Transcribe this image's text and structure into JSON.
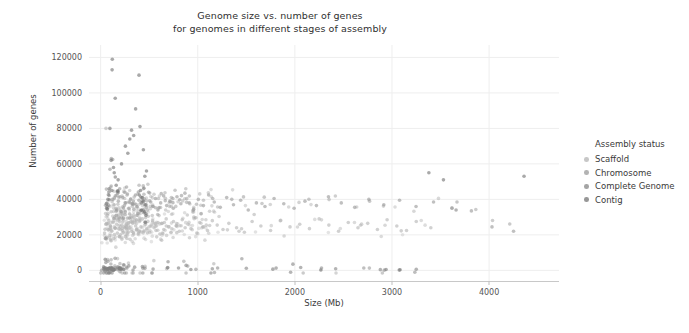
{
  "chart_data": {
    "type": "scatter",
    "title": "Genome size vs. number of genes\nfor genomes in different stages of assembly",
    "title_line1": "Genome size vs. number of genes",
    "title_line2": "for genomes in different stages of assembly",
    "xlabel": "Size (Mb)",
    "ylabel": "Number of genes",
    "xlim": [
      -120,
      4720
    ],
    "ylim": [
      -6000,
      127000
    ],
    "xticks": [
      0,
      1000,
      2000,
      3000,
      4000
    ],
    "xticklabels": [
      "0",
      "1000",
      "2000",
      "3000",
      "4000"
    ],
    "yticks": [
      0,
      20000,
      40000,
      60000,
      80000,
      100000,
      120000
    ],
    "yticklabels": [
      "0",
      "20000",
      "40000",
      "60000",
      "80000",
      "100000",
      "120000"
    ],
    "grid": true,
    "grid_color": "#eeeeee",
    "legend": {
      "title": "Assembly status",
      "position": "right",
      "entries": [
        {
          "label": "Scaffold",
          "color": "#b4b4b4"
        },
        {
          "label": "Chromosome",
          "color": "#9a9a9a"
        },
        {
          "label": "Complete Genome",
          "color": "#868686"
        },
        {
          "label": "Contig",
          "color": "#747474"
        }
      ]
    },
    "marker": {
      "shape": "circle",
      "size_px": 3.6,
      "opacity": 0.62,
      "base_color": "#808080"
    },
    "series": [
      {
        "name": "Scaffold",
        "color": "#b4b4b4",
        "points": [
          [
            40,
            21000
          ],
          [
            55,
            80000
          ],
          [
            62,
            26500
          ],
          [
            70,
            31000
          ],
          [
            78,
            23000
          ],
          [
            85,
            28000
          ],
          [
            92,
            19500
          ],
          [
            100,
            25000
          ],
          [
            108,
            33000
          ],
          [
            115,
            22000
          ],
          [
            120,
            40000
          ],
          [
            128,
            27000
          ],
          [
            135,
            18000
          ],
          [
            142,
            30000
          ],
          [
            150,
            24000
          ],
          [
            158,
            35000
          ],
          [
            165,
            26000
          ],
          [
            172,
            21000
          ],
          [
            180,
            29000
          ],
          [
            188,
            23500
          ],
          [
            195,
            27500
          ],
          [
            202,
            20000
          ],
          [
            210,
            32000
          ],
          [
            218,
            25500
          ],
          [
            225,
            22500
          ],
          [
            232,
            28500
          ],
          [
            240,
            24500
          ],
          [
            248,
            31500
          ],
          [
            255,
            19000
          ],
          [
            262,
            26000
          ],
          [
            270,
            23000
          ],
          [
            278,
            29500
          ],
          [
            285,
            21500
          ],
          [
            292,
            27000
          ],
          [
            300,
            24000
          ],
          [
            310,
            30000
          ],
          [
            320,
            22000
          ],
          [
            330,
            26500
          ],
          [
            340,
            20500
          ],
          [
            350,
            28000
          ],
          [
            360,
            25000
          ],
          [
            370,
            23000
          ],
          [
            380,
            31000
          ],
          [
            390,
            21000
          ],
          [
            400,
            27500
          ],
          [
            415,
            24500
          ],
          [
            430,
            29000
          ],
          [
            445,
            22000
          ],
          [
            460,
            26000
          ],
          [
            475,
            23500
          ],
          [
            490,
            30500
          ],
          [
            505,
            21500
          ],
          [
            520,
            25500
          ],
          [
            535,
            28000
          ],
          [
            550,
            24000
          ],
          [
            570,
            22500
          ],
          [
            590,
            27000
          ],
          [
            610,
            20500
          ],
          [
            630,
            26500
          ],
          [
            650,
            23000
          ],
          [
            675,
            29000
          ],
          [
            700,
            24500
          ],
          [
            725,
            21500
          ],
          [
            750,
            27500
          ],
          [
            780,
            25000
          ],
          [
            810,
            22000
          ],
          [
            840,
            28500
          ],
          [
            870,
            24000
          ],
          [
            900,
            26000
          ],
          [
            930,
            23500
          ],
          [
            960,
            30000
          ],
          [
            990,
            21000
          ],
          [
            1020,
            27000
          ],
          [
            1060,
            24500
          ],
          [
            1100,
            22500
          ],
          [
            1150,
            28000
          ],
          [
            1200,
            25500
          ],
          [
            1260,
            23000
          ],
          [
            1320,
            26500
          ],
          [
            1400,
            24000
          ],
          [
            1480,
            21500
          ],
          [
            1560,
            27500
          ],
          [
            1650,
            25000
          ],
          [
            1750,
            22500
          ],
          [
            1850,
            28000
          ],
          [
            1950,
            24500
          ],
          [
            2050,
            26000
          ],
          [
            2150,
            23500
          ],
          [
            2250,
            29000
          ],
          [
            2350,
            25500
          ],
          [
            2450,
            22000
          ],
          [
            2550,
            27000
          ],
          [
            2650,
            24000
          ],
          [
            2750,
            26500
          ],
          [
            2850,
            23000
          ],
          [
            2950,
            28500
          ],
          [
            3050,
            25000
          ],
          [
            3150,
            22500
          ],
          [
            3250,
            27500
          ],
          [
            3400,
            24000
          ]
        ]
      },
      {
        "name": "Chromosome",
        "color": "#9a9a9a",
        "points": [
          [
            48,
            18000
          ],
          [
            66,
            36000
          ],
          [
            84,
            44000
          ],
          [
            96,
            57000
          ],
          [
            110,
            63000
          ],
          [
            124,
            62500
          ],
          [
            138,
            37000
          ],
          [
            152,
            42000
          ],
          [
            166,
            34000
          ],
          [
            182,
            39000
          ],
          [
            196,
            46000
          ],
          [
            212,
            33000
          ],
          [
            228,
            41000
          ],
          [
            244,
            36500
          ],
          [
            260,
            38000
          ],
          [
            276,
            43000
          ],
          [
            292,
            35000
          ],
          [
            308,
            40000
          ],
          [
            324,
            37500
          ],
          [
            342,
            34500
          ],
          [
            358,
            42500
          ],
          [
            376,
            36000
          ],
          [
            394,
            39500
          ],
          [
            412,
            33500
          ],
          [
            432,
            41000
          ],
          [
            452,
            37000
          ],
          [
            472,
            35500
          ],
          [
            494,
            44000
          ],
          [
            516,
            38500
          ],
          [
            540,
            36000
          ],
          [
            565,
            40500
          ],
          [
            590,
            34000
          ],
          [
            618,
            38000
          ],
          [
            648,
            42000
          ],
          [
            680,
            36500
          ],
          [
            712,
            39000
          ],
          [
            748,
            35000
          ],
          [
            786,
            41500
          ],
          [
            826,
            37500
          ],
          [
            868,
            43500
          ],
          [
            912,
            38000
          ],
          [
            958,
            34500
          ],
          [
            1006,
            40000
          ],
          [
            1058,
            36500
          ],
          [
            1112,
            42500
          ],
          [
            1170,
            38500
          ],
          [
            1232,
            35500
          ],
          [
            1298,
            41000
          ],
          [
            1368,
            37000
          ],
          [
            1442,
            39500
          ],
          [
            1520,
            34000
          ],
          [
            1604,
            38000
          ],
          [
            1692,
            36000
          ],
          [
            1786,
            40500
          ],
          [
            1886,
            37500
          ],
          [
            1992,
            35000
          ],
          [
            2104,
            39000
          ],
          [
            2222,
            36500
          ],
          [
            2346,
            41500
          ],
          [
            2478,
            38000
          ],
          [
            2616,
            35500
          ],
          [
            2762,
            40000
          ],
          [
            2916,
            37000
          ],
          [
            3078,
            39500
          ],
          [
            3248,
            36000
          ],
          [
            3428,
            38500
          ],
          [
            3618,
            35000
          ],
          [
            3818,
            33500
          ],
          [
            4030,
            24500
          ],
          [
            4252,
            22000
          ]
        ]
      },
      {
        "name": "Complete Genome",
        "color": "#868686",
        "points": [
          [
            30,
            2000
          ],
          [
            45,
            1500
          ],
          [
            58,
            1200
          ],
          [
            72,
            900
          ],
          [
            88,
            1100
          ],
          [
            105,
            800
          ],
          [
            125,
            1000
          ],
          [
            148,
            700
          ],
          [
            175,
            1300
          ],
          [
            205,
            600
          ],
          [
            240,
            3000
          ],
          [
            290,
            2500
          ],
          [
            350,
            1800
          ],
          [
            430,
            2200
          ],
          [
            540,
            700
          ],
          [
            690,
            1500
          ],
          [
            880,
            2800
          ],
          [
            1150,
            900
          ],
          [
            1500,
            1200
          ],
          [
            1980,
            3500
          ],
          [
            2060,
            1600
          ],
          [
            2420,
            900
          ],
          [
            2880,
            400
          ],
          [
            3250,
            600
          ],
          [
            3660,
            34000
          ]
        ]
      },
      {
        "name": "Contig",
        "color": "#747474",
        "points": [
          [
            120,
            119000
          ],
          [
            118,
            113000
          ],
          [
            95,
            80000
          ],
          [
            150,
            97000
          ],
          [
            255,
            70000
          ],
          [
            318,
            79000
          ],
          [
            395,
            110000
          ],
          [
            360,
            91000
          ],
          [
            405,
            81000
          ],
          [
            440,
            68000
          ],
          [
            472,
            56000
          ],
          [
            455,
            53000
          ],
          [
            340,
            76000
          ],
          [
            300,
            74000
          ],
          [
            280,
            66000
          ],
          [
            215,
            60000
          ],
          [
            180,
            51000
          ],
          [
            160,
            48000
          ],
          [
            140,
            55000
          ],
          [
            132,
            58000
          ],
          [
            108,
            62000
          ],
          [
            88,
            46000
          ],
          [
            75,
            40000
          ],
          [
            62,
            35000
          ],
          [
            410,
            45000
          ],
          [
            426,
            41000
          ],
          [
            440,
            39000
          ],
          [
            452,
            33000
          ],
          [
            466,
            31000
          ],
          [
            3380,
            55000
          ],
          [
            3530,
            51000
          ],
          [
            4360,
            53000
          ]
        ]
      }
    ]
  }
}
